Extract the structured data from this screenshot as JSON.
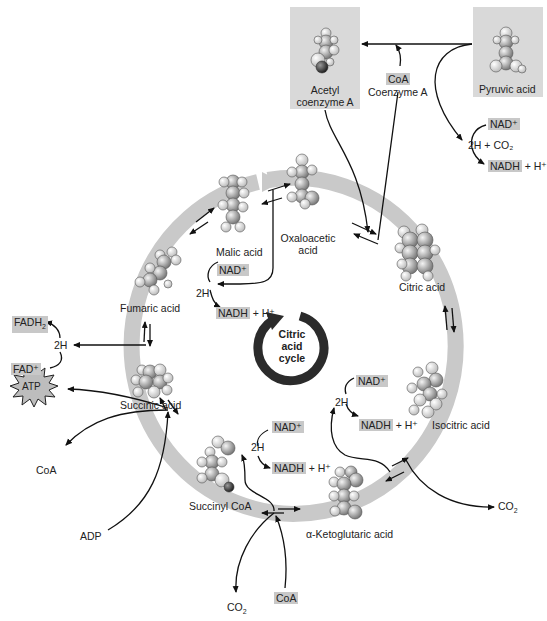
{
  "diagram": {
    "title": "Citric acid cycle",
    "center_label": [
      "Citric",
      "acid",
      "cycle"
    ],
    "colors": {
      "ring": "#c9c9c9",
      "box": "#d9d9d9",
      "highlight": "#c8c8c8",
      "arrow": "#111111",
      "center_arrow": "#2b2b2b"
    },
    "inputs": {
      "pyruvic_acid": "Pyruvic acid",
      "acetyl_coa": [
        "Acetyl",
        "coenzyme A"
      ],
      "coa_in": "CoA",
      "coenzyme_a": "Coenzyme A",
      "pyruvate_nad": "NAD⁺",
      "pyruvate_2h_co2": "2H + CO₂",
      "pyruvate_nadh": "NADH",
      "pyruvate_h": "+ H⁺"
    },
    "intermediates": [
      {
        "id": "oxaloacetic",
        "label": [
          "Oxaloacetic",
          "acid"
        ]
      },
      {
        "id": "citric",
        "label": "Citric acid"
      },
      {
        "id": "isocitric",
        "label": "Isocitric acid"
      },
      {
        "id": "ketoglutaric",
        "label": "α-Ketoglutaric acid"
      },
      {
        "id": "succinyl_coa",
        "label": "Succinyl CoA"
      },
      {
        "id": "succinic",
        "label": "Succinic acid"
      },
      {
        "id": "fumaric",
        "label": "Fumaric acid"
      },
      {
        "id": "malic",
        "label": "Malic acid"
      }
    ],
    "side_reactions": {
      "malic": {
        "nad": "NAD⁺",
        "two_h": "2H",
        "nadh": "NADH",
        "h": "+ H⁺"
      },
      "fumaric": {
        "fadh2": "FADH",
        "fadh2_sub": "2",
        "two_h": "2H",
        "fad": "FAD⁺"
      },
      "succinic": {
        "atp": "ATP",
        "coa": "CoA",
        "adp": "ADP"
      },
      "succinyl": {
        "nad": "NAD⁺",
        "two_h": "2H",
        "nadh": "NADH",
        "h": "+ H⁺",
        "co2": "CO",
        "co2_sub": "2",
        "coa": "CoA"
      },
      "isocitric": {
        "nad": "NAD⁺",
        "two_h": "2H",
        "nadh": "NADH",
        "h": "+ H⁺",
        "co2": "CO",
        "co2_sub": "2"
      }
    }
  }
}
